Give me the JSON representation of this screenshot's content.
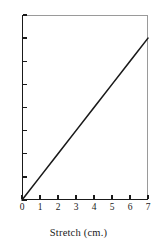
{
  "chart_data": {
    "type": "line",
    "title": "",
    "subtitle": "",
    "xlabel": "Stretch (cm.)",
    "ylabel": "",
    "xlim": [
      0,
      7
    ],
    "ylim": [
      0,
      8
    ],
    "xticks": [
      0,
      1,
      2,
      3,
      4,
      5,
      6,
      7
    ],
    "yticks": [
      0,
      1,
      2,
      3,
      4,
      5,
      6,
      7,
      8
    ],
    "xtick_labels": [
      "0",
      "1",
      "2",
      "3",
      "4",
      "5",
      "6",
      "7"
    ],
    "ytick_labels": [
      "0",
      "1",
      "2",
      "3",
      "4",
      "5",
      "6",
      "7",
      "8"
    ],
    "grid": false,
    "legend": false,
    "legend_position": "none",
    "annotations": [],
    "series": [
      {
        "name": "load vs stretch",
        "type": "line",
        "color": "#1a1a1a",
        "linewidth": 1.6,
        "x": [
          0,
          7
        ],
        "y": [
          0,
          7
        ],
        "points": [
          {
            "x": 0,
            "y": 0
          },
          {
            "x": 1,
            "y": 1
          },
          {
            "x": 2,
            "y": 2
          },
          {
            "x": 3,
            "y": 3
          },
          {
            "x": 4,
            "y": 4
          },
          {
            "x": 5,
            "y": 5
          },
          {
            "x": 6,
            "y": 6
          },
          {
            "x": 7,
            "y": 7
          }
        ]
      }
    ]
  },
  "figure": {
    "caption": "Stretch (cm.)",
    "background_color": "#ffffff",
    "axis_color": "#1a1a1a",
    "frame_color": "#9a9a9a",
    "line_color": "#1a1a1a"
  }
}
